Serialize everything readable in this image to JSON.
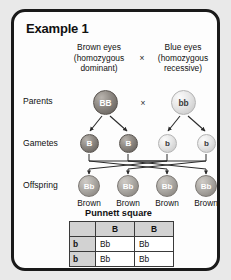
{
  "card": {
    "title": "Example 1"
  },
  "parents_header": {
    "left": "Brown eyes\n(homozygous\ndominant)",
    "left_line1": "Brown eyes",
    "left_line2": "(homozygous",
    "left_line3": "dominant)",
    "right_line1": "Blue eyes",
    "right_line2": "(homozygous",
    "right_line3": "recessive)",
    "cross_symbol": "×"
  },
  "row_labels": {
    "parents": "Parents",
    "gametes": "Gametes",
    "offspring": "Offspring"
  },
  "parents": {
    "cross_symbol": "×",
    "circles": [
      {
        "genotype": "BB",
        "shade": "dark"
      },
      {
        "genotype": "bb",
        "shade": "light"
      }
    ]
  },
  "gametes": {
    "circles": [
      {
        "allele": "B",
        "shade": "dark"
      },
      {
        "allele": "B",
        "shade": "dark"
      },
      {
        "allele": "b",
        "shade": "light"
      },
      {
        "allele": "b",
        "shade": "light"
      }
    ]
  },
  "offspring": {
    "circles": [
      {
        "genotype": "Bb",
        "phenotype": "Brown"
      },
      {
        "genotype": "Bb",
        "phenotype": "Brown"
      },
      {
        "genotype": "Bb",
        "phenotype": "Brown"
      },
      {
        "genotype": "Bb",
        "phenotype": "Brown"
      }
    ]
  },
  "punnett": {
    "title": "Punnett square",
    "corner": "",
    "column_headers": [
      "B",
      "B"
    ],
    "row_headers": [
      "b",
      "b"
    ],
    "cells": [
      [
        "Bb",
        "Bb"
      ],
      [
        "Bb",
        "Bb"
      ]
    ]
  },
  "colors": {
    "card_border": "#1a1a1a",
    "card_background": "#fdfdfd",
    "page_background": "#e9e9e9",
    "dominant_circle": "#7a756f",
    "recessive_circle": "#e0e0e0",
    "heterozygous_circle": "#a5a19c",
    "table_header_fill": "#d2d2d2",
    "table_cell_fill": "#ffffff"
  }
}
